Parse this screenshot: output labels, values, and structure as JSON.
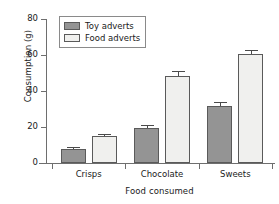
{
  "chart_data": {
    "type": "bar",
    "title": "",
    "subtitle": "",
    "xlabel": "Food consumed",
    "ylabel": "Consumption (g)",
    "categories": [
      "Crisps",
      "Chocolate",
      "Sweets"
    ],
    "series": [
      {
        "name": "Toy adverts",
        "color": "#949494",
        "values": [
          8,
          19.5,
          31.5
        ],
        "errors": [
          0.8,
          1.8,
          2.2
        ]
      },
      {
        "name": "Food adverts",
        "color": "#f0f0ee",
        "values": [
          15.2,
          48.5,
          60.5
        ],
        "errors": [
          0.7,
          2.8,
          2.2
        ]
      }
    ],
    "ylim": [
      0,
      80
    ],
    "yticks": [
      0,
      20,
      40,
      60,
      80
    ],
    "ytick_labels": [
      "0",
      "20",
      "40",
      "60",
      "80"
    ],
    "grid": false,
    "legend_position": "top-left",
    "error_bar_style": "upper-only-with-caps",
    "axis_color": "#6e6e6e",
    "bar_outline_color": "#5a5a5a",
    "background_color": "#ffffff"
  },
  "legend": {
    "entries": [
      {
        "label": "Toy adverts"
      },
      {
        "label": "Food adverts"
      }
    ]
  }
}
